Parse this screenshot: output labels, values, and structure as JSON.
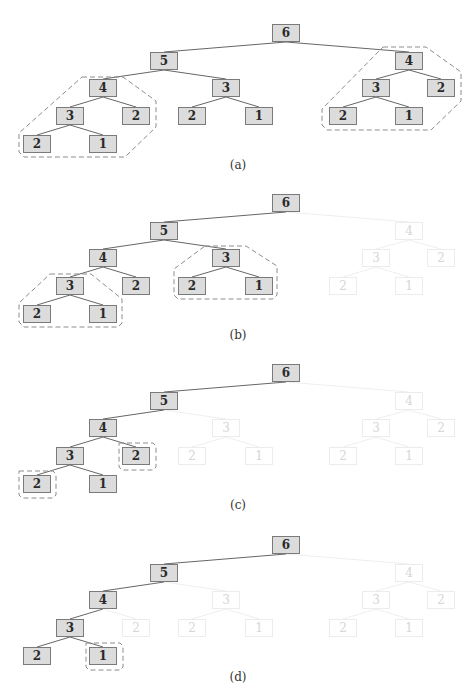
{
  "figure": {
    "colors": {
      "active_fill": "#dcdcdc",
      "active_border": "#7a7a7a",
      "faded_border": "#ececec",
      "faded_text": "#d6d6d6",
      "edge": "#555555",
      "hull": "#8c8c8c"
    },
    "tree": {
      "nodes": [
        {
          "id": "n6",
          "label": "6",
          "x": 272,
          "y": 24
        },
        {
          "id": "n5",
          "label": "5",
          "x": 150,
          "y": 52
        },
        {
          "id": "n4r",
          "label": "4",
          "x": 395,
          "y": 52
        },
        {
          "id": "n4",
          "label": "4",
          "x": 89,
          "y": 79
        },
        {
          "id": "n3m",
          "label": "3",
          "x": 212,
          "y": 79
        },
        {
          "id": "n3r",
          "label": "3",
          "x": 362,
          "y": 79
        },
        {
          "id": "n2rr",
          "label": "2",
          "x": 427,
          "y": 79
        },
        {
          "id": "n3",
          "label": "3",
          "x": 56,
          "y": 107
        },
        {
          "id": "n2a",
          "label": "2",
          "x": 122,
          "y": 107
        },
        {
          "id": "n2m",
          "label": "2",
          "x": 178,
          "y": 107
        },
        {
          "id": "n1m",
          "label": "1",
          "x": 245,
          "y": 107
        },
        {
          "id": "n2r",
          "label": "2",
          "x": 329,
          "y": 107
        },
        {
          "id": "n1r",
          "label": "1",
          "x": 395,
          "y": 107
        },
        {
          "id": "n2",
          "label": "2",
          "x": 23,
          "y": 135
        },
        {
          "id": "n1",
          "label": "1",
          "x": 89,
          "y": 135
        }
      ],
      "edges": [
        [
          "n6",
          "n5"
        ],
        [
          "n6",
          "n4r"
        ],
        [
          "n5",
          "n4"
        ],
        [
          "n5",
          "n3m"
        ],
        [
          "n4",
          "n3"
        ],
        [
          "n4",
          "n2a"
        ],
        [
          "n3",
          "n2"
        ],
        [
          "n3",
          "n1"
        ],
        [
          "n3m",
          "n2m"
        ],
        [
          "n3m",
          "n1m"
        ],
        [
          "n4r",
          "n3r"
        ],
        [
          "n4r",
          "n2rr"
        ],
        [
          "n3r",
          "n2r"
        ],
        [
          "n3r",
          "n1r"
        ]
      ]
    },
    "panels": [
      {
        "id": "a",
        "caption": "(a)",
        "top": 0,
        "faded": [],
        "hulls": [
          "82,77 123,77 156,101 156,127 125,157 24,157 19,152 19,133",
          "383,47 426,47 461,72 461,101 431,130 327,130 322,125 322,109"
        ]
      },
      {
        "id": "b",
        "caption": "(b)",
        "top": 170,
        "faded": [
          "n4r",
          "n3r",
          "n2rr",
          "n2r",
          "n1r"
        ],
        "hulls": [
          "50,104 91,104 122,129 122,153 118,157 24,157 19,152 19,133",
          "205,76 246,76 277,96 277,125 273,129 178,129 174,125 174,99"
        ]
      },
      {
        "id": "c",
        "caption": "(c)",
        "top": 340,
        "faded": [
          "n3m",
          "n2m",
          "n1m",
          "n4r",
          "n3r",
          "n2rr",
          "n2r",
          "n1r"
        ],
        "hulls": [
          "119,103 153,103 156,106 156,127 153,130 122,130 119,127",
          "19,131 53,131 56,134 56,155 53,158 22,158 19,155"
        ]
      },
      {
        "id": "d",
        "caption": "(d)",
        "top": 512,
        "faded": [
          "n2a",
          "n3m",
          "n2m",
          "n1m",
          "n4r",
          "n3r",
          "n2rr",
          "n2r",
          "n1r"
        ],
        "hulls": [
          "86,131 120,131 123,134 123,155 120,158 89,158 86,155"
        ]
      }
    ]
  }
}
